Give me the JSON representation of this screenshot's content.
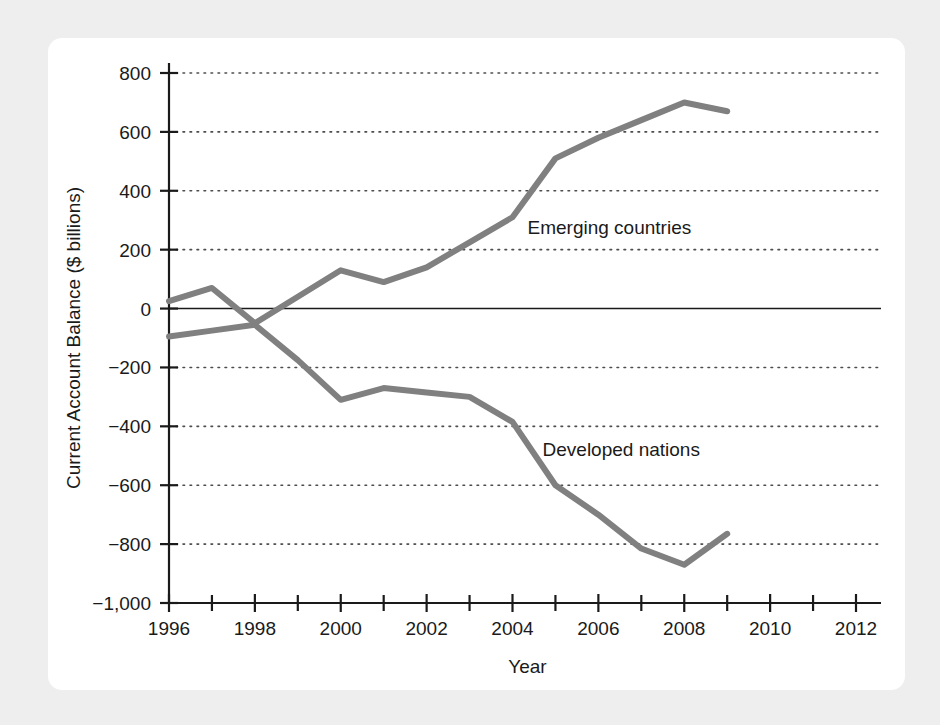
{
  "figure": {
    "background_color": "#eeeeee",
    "card_color": "#ffffff"
  },
  "chart_data": {
    "type": "line",
    "title": "",
    "xlabel": "Year",
    "ylabel": "Current Account Balance ($ billions)",
    "xlim": [
      1996,
      2012
    ],
    "ylim": [
      -1000,
      800
    ],
    "xticks": [
      1996,
      1998,
      2000,
      2002,
      2004,
      2006,
      2008,
      2010,
      2012
    ],
    "xtick_labels": [
      "1996",
      "1998",
      "2000",
      "2002",
      "2004",
      "2006",
      "2008",
      "2010",
      "2012"
    ],
    "xminor_step": 1,
    "yticks": [
      -1000,
      -800,
      -600,
      -400,
      -200,
      0,
      200,
      400,
      600,
      800
    ],
    "ytick_labels": [
      "−1,000",
      "−800",
      "−600",
      "−400",
      "−200",
      "0",
      "200",
      "400",
      "600",
      "800"
    ],
    "grid": true,
    "grid_style": "dotted",
    "grid_axis": "y",
    "zero_line": true,
    "legend": "inline-annotations",
    "line_color": "#808080",
    "line_width": 6,
    "x": [
      1996,
      1997,
      1998,
      1999,
      2000,
      2001,
      2002,
      2003,
      2004,
      2005,
      2006,
      2007,
      2008,
      2009
    ],
    "series": [
      {
        "name": "Emerging countries",
        "label_x": 2004.35,
        "label_y": 275,
        "values": [
          25,
          70,
          -50,
          40,
          130,
          90,
          140,
          225,
          310,
          510,
          580,
          640,
          700,
          670
        ]
      },
      {
        "name": "Developed nations",
        "label_x": 2004.7,
        "label_y": -480,
        "values": [
          -95,
          -75,
          -55,
          -175,
          -310,
          -270,
          -285,
          -300,
          -385,
          -600,
          -700,
          -815,
          -870,
          -765
        ]
      }
    ]
  }
}
